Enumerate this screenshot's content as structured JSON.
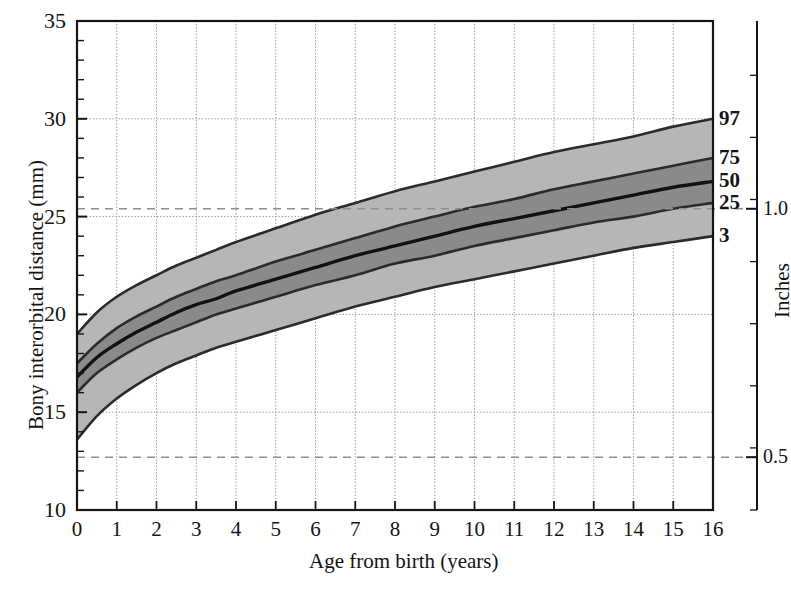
{
  "figure": {
    "background_color": "#ffffff",
    "ink_color": "#141414"
  },
  "chart_data": {
    "type": "line",
    "title": "",
    "subtitle": "",
    "xlabel": "Age from birth (years)",
    "ylabel": "Bony interorbital distance (mm)",
    "secondary_ylabel": "Inches",
    "xlim": [
      0,
      16
    ],
    "ylim": [
      10,
      35
    ],
    "xticks": [
      0,
      1,
      2,
      3,
      4,
      5,
      6,
      7,
      8,
      9,
      10,
      11,
      12,
      13,
      14,
      15,
      16
    ],
    "xtick_labels": [
      "0",
      "1",
      "2",
      "3",
      "4",
      "5",
      "6",
      "7",
      "8",
      "9",
      "10",
      "11",
      "12",
      "13",
      "14",
      "15",
      "16"
    ],
    "yticks": [
      10,
      15,
      20,
      25,
      30,
      35
    ],
    "ytick_labels": [
      "10",
      "15",
      "20",
      "25",
      "30",
      "35"
    ],
    "yminor_step": 1,
    "grid": true,
    "grid_style": "dotted-light",
    "legend_position": "right-edge-curve-labels",
    "x": [
      0,
      0.5,
      1,
      1.5,
      2,
      2.5,
      3,
      3.5,
      4,
      5,
      6,
      7,
      8,
      9,
      10,
      11,
      12,
      13,
      14,
      15,
      16
    ],
    "series": [
      {
        "name": "97",
        "label": "97",
        "percentile": 97,
        "color": "#2b2b2b",
        "values": [
          19.0,
          20.1,
          20.9,
          21.5,
          22.0,
          22.5,
          22.9,
          23.3,
          23.7,
          24.4,
          25.1,
          25.7,
          26.3,
          26.8,
          27.3,
          27.8,
          28.3,
          28.7,
          29.1,
          29.6,
          30.0
        ]
      },
      {
        "name": "75",
        "label": "75",
        "percentile": 75,
        "color": "#2b2b2b",
        "values": [
          17.5,
          18.5,
          19.3,
          19.9,
          20.4,
          20.9,
          21.3,
          21.7,
          22.0,
          22.7,
          23.3,
          23.9,
          24.5,
          25.0,
          25.5,
          25.9,
          26.4,
          26.8,
          27.2,
          27.6,
          28.0
        ]
      },
      {
        "name": "50",
        "label": "50",
        "percentile": 50,
        "color": "#111111",
        "values": [
          16.8,
          17.8,
          18.5,
          19.1,
          19.6,
          20.1,
          20.5,
          20.8,
          21.2,
          21.8,
          22.4,
          23.0,
          23.5,
          24.0,
          24.5,
          24.9,
          25.3,
          25.7,
          26.1,
          26.5,
          26.8
        ]
      },
      {
        "name": "25",
        "label": "25",
        "percentile": 25,
        "color": "#2b2b2b",
        "values": [
          16.0,
          17.0,
          17.7,
          18.3,
          18.8,
          19.2,
          19.6,
          20.0,
          20.3,
          20.9,
          21.5,
          22.0,
          22.6,
          23.0,
          23.5,
          23.9,
          24.3,
          24.7,
          25.0,
          25.4,
          25.7
        ]
      },
      {
        "name": "3",
        "label": "3",
        "percentile": 3,
        "color": "#2b2b2b",
        "values": [
          13.6,
          14.8,
          15.7,
          16.4,
          17.0,
          17.5,
          17.9,
          18.3,
          18.6,
          19.2,
          19.8,
          20.4,
          20.9,
          21.4,
          21.8,
          22.2,
          22.6,
          23.0,
          23.4,
          23.7,
          24.0
        ]
      }
    ],
    "bands": [
      {
        "name": "3-25",
        "lower": "3",
        "upper": "25",
        "fill": "#b6b6b6"
      },
      {
        "name": "25-50",
        "lower": "25",
        "upper": "50",
        "fill": "#8a8a8a"
      },
      {
        "name": "50-75",
        "lower": "50",
        "upper": "75",
        "fill": "#8a8a8a"
      },
      {
        "name": "75-97",
        "lower": "75",
        "upper": "97",
        "fill": "#b6b6b6"
      }
    ],
    "annotations": [
      {
        "name": "inch-ref-1",
        "type": "hline",
        "y": 25.4,
        "label": "1.0",
        "style": "dashed",
        "color": "#8e8e8e"
      },
      {
        "name": "inch-ref-05",
        "type": "hline",
        "y": 12.7,
        "label": "0.5",
        "style": "dashed",
        "color": "#8e8e8e"
      }
    ],
    "curve_labels": [
      {
        "text": "97",
        "y": 30.0
      },
      {
        "text": "75",
        "y": 28.0
      },
      {
        "text": "50",
        "y": 26.8
      },
      {
        "text": "25",
        "y": 25.7
      },
      {
        "text": "3",
        "y": 24.0
      }
    ],
    "inch_axis": {
      "label": "Inches",
      "ticks": [
        {
          "value": "1.0",
          "mm": 25.4
        },
        {
          "value": "0.5",
          "mm": 12.7
        }
      ]
    }
  }
}
